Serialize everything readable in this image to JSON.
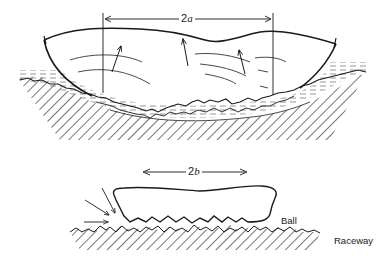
{
  "figure": {
    "top_panel": {
      "dimension_label": {
        "prefix": "2",
        "variable": "a"
      },
      "description": "Large contact region (asperity-rough surfaces) with lubricant film and pressure arrows"
    },
    "bottom_panel": {
      "dimension_label": {
        "prefix": "2",
        "variable": "b"
      },
      "labels": {
        "ball": "Ball",
        "raceway": "Raceway"
      },
      "description": "Ball flattened contact patch on rough raceway with incoming flow arrows"
    },
    "colors": {
      "ink": "#1a1a1a",
      "background": "#ffffff",
      "lubricant_dash": "#6a6a6a"
    }
  }
}
